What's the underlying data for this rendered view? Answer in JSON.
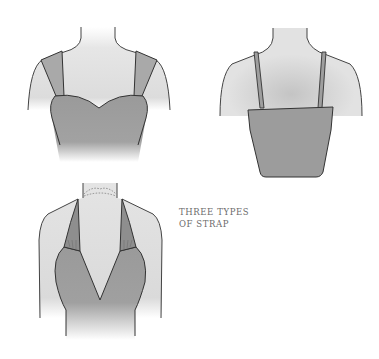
{
  "illustration": {
    "title": "Three types of strap",
    "figures": [
      {
        "name": "wide-strap-sweetheart-bodice",
        "view": "front"
      },
      {
        "name": "spaghetti-strap-straight-bodice",
        "view": "back"
      },
      {
        "name": "halter-neck-v-neckline",
        "view": "front"
      }
    ]
  },
  "caption": {
    "line1": "THREE TYPES",
    "line2": "OF STRAP"
  },
  "colors": {
    "background": "#ffffff",
    "skin": "#e2e2e2",
    "garment": "#9c9c9c",
    "strap": "#a8a8a8",
    "outline": "#3a3a3a",
    "caption_text": "#6b6b6b"
  }
}
